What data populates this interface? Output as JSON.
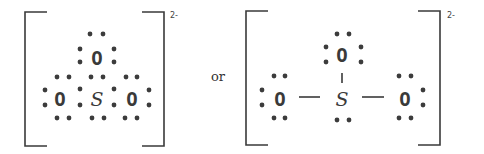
{
  "connector_text": "or",
  "structures": [
    {
      "name": "dot-structure",
      "charge": "2-",
      "atoms": [
        {
          "symbol": "O",
          "x": 97,
          "y": 58,
          "role": "top-oxygen"
        },
        {
          "symbol": "O",
          "x": 60,
          "y": 99,
          "role": "left-oxygen"
        },
        {
          "symbol": "S",
          "x": 97,
          "y": 99,
          "role": "sulfur"
        },
        {
          "symbol": "O",
          "x": 132,
          "y": 99,
          "role": "right-oxygen"
        }
      ],
      "dots": [
        [
          90,
          34
        ],
        [
          103,
          34
        ],
        [
          80,
          49
        ],
        [
          80,
          62
        ],
        [
          114,
          49
        ],
        [
          114,
          62
        ],
        [
          57,
          77
        ],
        [
          69,
          77
        ],
        [
          91,
          77
        ],
        [
          103,
          77
        ],
        [
          126,
          77
        ],
        [
          137,
          77
        ],
        [
          45,
          90
        ],
        [
          45,
          105
        ],
        [
          80,
          89
        ],
        [
          80,
          105
        ],
        [
          114,
          89
        ],
        [
          114,
          105
        ],
        [
          149,
          90
        ],
        [
          149,
          105
        ],
        [
          57,
          118
        ],
        [
          69,
          118
        ],
        [
          92,
          118
        ],
        [
          104,
          118
        ],
        [
          125,
          118
        ],
        [
          137,
          118
        ]
      ],
      "bonds": [],
      "bracket": {
        "left_x": 25,
        "right_x": 164,
        "top_y": 12,
        "bottom_y": 146,
        "arm": 22
      },
      "charge_pos": [
        170,
        18
      ]
    },
    {
      "name": "line-structure",
      "charge": "2-",
      "atoms": [
        {
          "symbol": "O",
          "x": 342,
          "y": 55,
          "role": "top-oxygen"
        },
        {
          "symbol": "O",
          "x": 280,
          "y": 99,
          "role": "left-oxygen"
        },
        {
          "symbol": "S",
          "x": 342,
          "y": 99,
          "role": "sulfur"
        },
        {
          "symbol": "O",
          "x": 405,
          "y": 99,
          "role": "right-oxygen"
        }
      ],
      "dots": [
        [
          337,
          34
        ],
        [
          349,
          34
        ],
        [
          326,
          47
        ],
        [
          326,
          62
        ],
        [
          361,
          47
        ],
        [
          361,
          62
        ],
        [
          274,
          76
        ],
        [
          285,
          76
        ],
        [
          262,
          90
        ],
        [
          262,
          105
        ],
        [
          274,
          118
        ],
        [
          285,
          118
        ],
        [
          337,
          120
        ],
        [
          349,
          120
        ],
        [
          399,
          76
        ],
        [
          411,
          76
        ],
        [
          423,
          90
        ],
        [
          423,
          105
        ],
        [
          399,
          118
        ],
        [
          411,
          118
        ]
      ],
      "bonds": [
        [
          342,
          73,
          342,
          83
        ],
        [
          299,
          97,
          320,
          97
        ],
        [
          362,
          97,
          384,
          97
        ]
      ],
      "bracket": {
        "left_x": 246,
        "right_x": 440,
        "top_y": 11,
        "bottom_y": 145,
        "arm": 22
      },
      "charge_pos": [
        447,
        18
      ]
    }
  ],
  "or_pos": [
    211,
    81
  ]
}
